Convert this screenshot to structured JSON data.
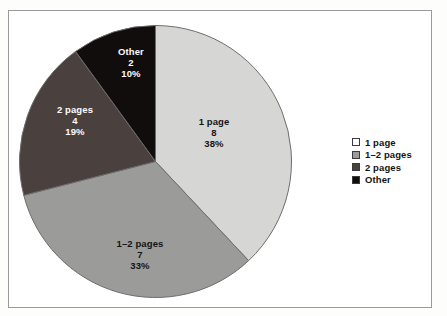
{
  "chart_data": {
    "type": "pie",
    "title": "",
    "subtitle": "",
    "xlabel": "",
    "ylabel": "",
    "legend_position": "right",
    "grid": false,
    "start_angle_deg": 0,
    "direction": "clockwise",
    "total_count": 21,
    "categories": [
      "1 page",
      "1–2 pages",
      "2 pages",
      "Other"
    ],
    "values": [
      8,
      7,
      4,
      2
    ],
    "percentages": [
      38,
      33,
      19,
      10
    ],
    "percent_labels": [
      "38%",
      "33%",
      "19%",
      "10%"
    ],
    "value_labels": [
      "8",
      "7",
      "4",
      "2"
    ],
    "colors": [
      "#d6d6d4",
      "#9b9b99",
      "#4a403e",
      "#110d0c"
    ],
    "slices": [
      {
        "name": "1 page",
        "value": 8,
        "value_label": "8",
        "percent": 38,
        "percent_label": "38%",
        "color": "#d6d6d4",
        "label_color": "dark"
      },
      {
        "name": "1–2 pages",
        "value": 7,
        "value_label": "7",
        "percent": 33,
        "percent_label": "33%",
        "color": "#9b9b99",
        "label_color": "dark"
      },
      {
        "name": "2 pages",
        "value": 4,
        "value_label": "4",
        "percent": 19,
        "percent_label": "19%",
        "color": "#4a403e",
        "label_color": "light"
      },
      {
        "name": "Other",
        "value": 2,
        "value_label": "2",
        "percent": 10,
        "percent_label": "10%",
        "color": "#110d0c",
        "label_color": "light"
      }
    ]
  },
  "legend": {
    "items": [
      {
        "label": "1 page",
        "color": "#ffffff"
      },
      {
        "label": "1–2 pages",
        "color": "#9b9b99"
      },
      {
        "label": "2 pages",
        "color": "#4a403e"
      },
      {
        "label": "Other",
        "color": "#110d0c"
      }
    ]
  }
}
